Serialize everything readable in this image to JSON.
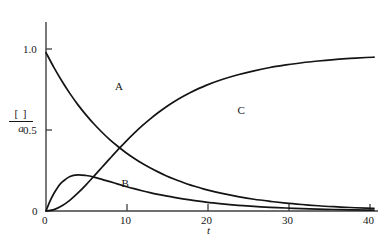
{
  "chart_data": {
    "type": "line",
    "title": "",
    "subtitle": "",
    "xlabel": "t",
    "ylabel": "[ ] / a",
    "ylabel_numerator": "[ ]",
    "ylabel_denominator": "a",
    "xlim": [
      0,
      41.5
    ],
    "ylim": [
      0,
      1.13
    ],
    "xticks": [
      0,
      10,
      20,
      30,
      40
    ],
    "xticklabels": [
      "0",
      "10",
      "20",
      "30",
      "40"
    ],
    "yticks": [
      0,
      0.5,
      1.0
    ],
    "yticklabels": [
      "0",
      "0.5",
      "1.0"
    ],
    "grid": false,
    "legend": "inline-curve-labels",
    "line_color": "#141414",
    "axis_color": "#3a3a3a",
    "series": [
      {
        "name": "A",
        "label": "A",
        "label_position": {
          "x": 9.0,
          "y": 0.79
        },
        "description": "reactant exponential decay",
        "x": [
          0,
          1,
          2,
          3,
          4,
          5,
          6,
          7,
          8,
          9,
          10,
          11,
          12,
          13,
          14,
          15,
          16,
          17,
          18,
          19,
          20,
          22,
          24,
          26,
          28,
          30,
          32,
          34,
          36,
          38,
          40,
          41
        ],
        "values": [
          1.0,
          0.905,
          0.819,
          0.741,
          0.67,
          0.607,
          0.549,
          0.497,
          0.449,
          0.407,
          0.368,
          0.333,
          0.301,
          0.273,
          0.247,
          0.223,
          0.202,
          0.183,
          0.165,
          0.15,
          0.135,
          0.111,
          0.091,
          0.074,
          0.061,
          0.05,
          0.041,
          0.033,
          0.027,
          0.022,
          0.018,
          0.017
        ]
      },
      {
        "name": "B",
        "label": "B",
        "label_position": {
          "x": 9.8,
          "y": 0.175
        },
        "description": "intermediate rises to maximum then decays",
        "x": [
          0,
          0.5,
          1,
          1.5,
          2,
          3,
          4,
          5,
          6,
          7,
          8,
          9,
          10,
          11,
          12,
          13,
          14,
          15,
          16,
          18,
          20,
          22,
          24,
          26,
          28,
          30,
          32,
          34,
          36,
          38,
          40,
          41
        ],
        "values": [
          0.0,
          0.062,
          0.112,
          0.152,
          0.182,
          0.218,
          0.228,
          0.224,
          0.214,
          0.2,
          0.185,
          0.17,
          0.155,
          0.141,
          0.128,
          0.116,
          0.105,
          0.095,
          0.086,
          0.07,
          0.056,
          0.045,
          0.036,
          0.029,
          0.023,
          0.019,
          0.015,
          0.012,
          0.0095,
          0.0076,
          0.006,
          0.0055
        ]
      },
      {
        "name": "C",
        "label": "C",
        "label_position": {
          "x": 24.3,
          "y": 0.635
        },
        "description": "product sigmoidal rise to plateau at 1.0",
        "x": [
          0,
          1,
          2,
          3,
          4,
          5,
          6,
          7,
          8,
          9,
          10,
          11,
          12,
          13,
          14,
          15,
          16,
          17,
          18,
          20,
          22,
          24,
          26,
          28,
          30,
          32,
          34,
          36,
          38,
          40,
          41
        ],
        "values": [
          0.0,
          0.009,
          0.033,
          0.069,
          0.114,
          0.165,
          0.22,
          0.276,
          0.332,
          0.387,
          0.44,
          0.49,
          0.537,
          0.58,
          0.62,
          0.657,
          0.69,
          0.72,
          0.747,
          0.793,
          0.83,
          0.86,
          0.885,
          0.906,
          0.922,
          0.936,
          0.947,
          0.956,
          0.963,
          0.969,
          0.971
        ]
      }
    ]
  },
  "axes": {
    "x_tick_0": "0",
    "x_tick_10": "10",
    "x_tick_20": "20",
    "x_tick_30": "30",
    "x_tick_40": "40",
    "y_tick_0": "0",
    "y_tick_05": "0.5",
    "y_tick_10": "1.0",
    "x_axis_title": "t",
    "y_axis_numerator": "[ ]",
    "y_axis_denominator": "a"
  },
  "curve_labels": {
    "a": "A",
    "b": "B",
    "c": "C"
  }
}
